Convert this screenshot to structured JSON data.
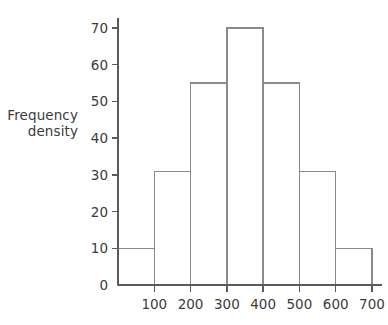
{
  "chart_data": {
    "type": "bar",
    "title": "",
    "subtitle": "",
    "xlabel": "",
    "ylabel": "Frequency density",
    "ylabel_lines": [
      "Frequency",
      "density"
    ],
    "categories": [
      "0-100",
      "100-200",
      "200-300",
      "300-400",
      "400-500",
      "500-600",
      "600-700"
    ],
    "bin_edges": [
      0,
      100,
      200,
      300,
      400,
      500,
      600,
      700
    ],
    "values": [
      10,
      31,
      55,
      70,
      55,
      31,
      10
    ],
    "xlim": [
      0,
      700
    ],
    "ylim": [
      0,
      75
    ],
    "xticks": [
      100,
      200,
      300,
      400,
      500,
      600,
      700
    ],
    "xtick_labels": [
      "100",
      "200",
      "300",
      "400",
      "500",
      "600",
      "700"
    ],
    "yticks": [
      0,
      10,
      20,
      30,
      40,
      50,
      60,
      70
    ],
    "ytick_labels": [
      "0",
      "10",
      "20",
      "30",
      "40",
      "50",
      "60",
      "70"
    ],
    "grid": false,
    "legend": false,
    "bar_fill": "#ffffff",
    "bar_stroke": "#8a8a8a",
    "axis_color": "#5a5a5a",
    "text_color": "#3b3b3b",
    "background": "#ffffff"
  }
}
